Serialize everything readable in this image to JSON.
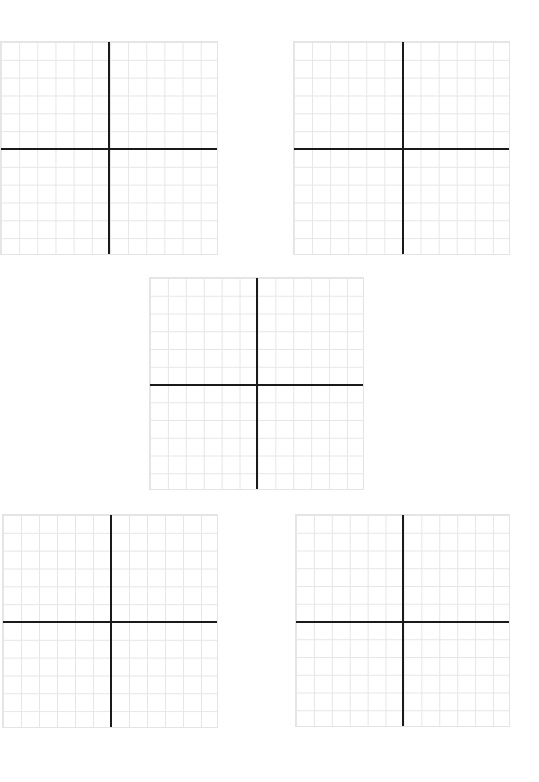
{
  "worksheet": {
    "panels": [
      {
        "id": "grid-1",
        "left": 0,
        "top": 41,
        "width": 218,
        "height": 214,
        "axis_x": 108,
        "axis_y": 107,
        "columns": 12,
        "rows": 12
      },
      {
        "id": "grid-2",
        "left": 293,
        "top": 41,
        "width": 217,
        "height": 214,
        "axis_x": 109,
        "axis_y": 107,
        "columns": 12,
        "rows": 12
      },
      {
        "id": "grid-3",
        "left": 149,
        "top": 277,
        "width": 215,
        "height": 213,
        "axis_x": 107,
        "axis_y": 107,
        "columns": 12,
        "rows": 12
      },
      {
        "id": "grid-4",
        "left": 2,
        "top": 514,
        "width": 216,
        "height": 214,
        "axis_x": 108,
        "axis_y": 107,
        "columns": 12,
        "rows": 12
      },
      {
        "id": "grid-5",
        "left": 295,
        "top": 514,
        "width": 215,
        "height": 213,
        "axis_x": 107,
        "axis_y": 107,
        "columns": 12,
        "rows": 12
      }
    ],
    "colors": {
      "gridline": "#e6e6e6",
      "axis": "#1a1a1a",
      "background": "#ffffff"
    }
  }
}
